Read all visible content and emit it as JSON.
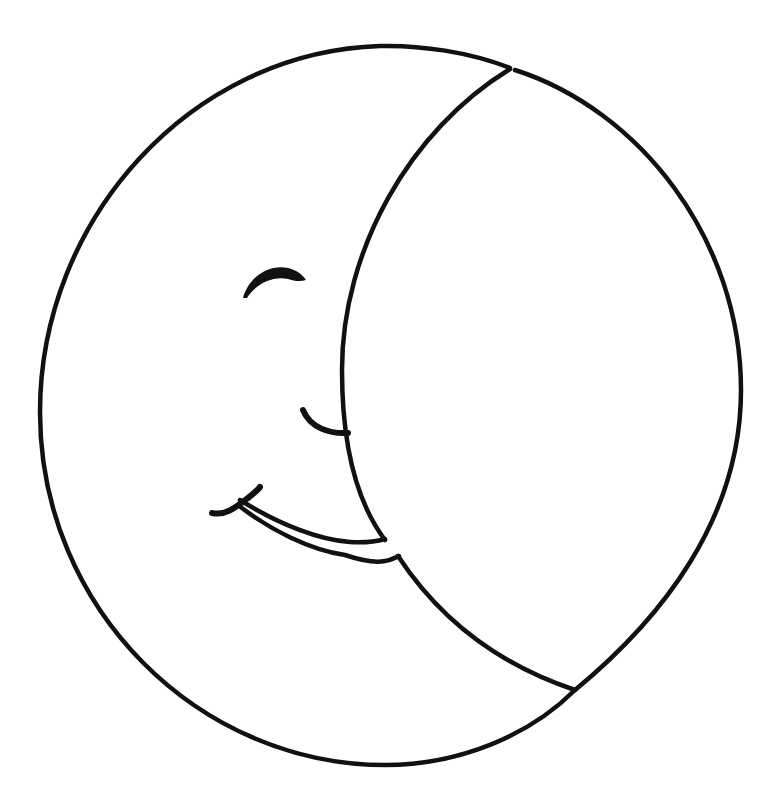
{
  "image": {
    "title": "Smiling crescent moon line drawing",
    "width": 765,
    "height": 810,
    "background": "#ffffff",
    "stroke_color": "#111111"
  },
  "elements": {
    "outer_circle": {
      "cx": 390,
      "cy": 405,
      "rx": 351,
      "ry": 360
    },
    "crescent_divider": "arc from top (512,70) bending left through (342,380) down to bottom (575,690)",
    "eye": "closed eye arc",
    "nose": "small curve",
    "mouth": "wide smile with lip"
  }
}
